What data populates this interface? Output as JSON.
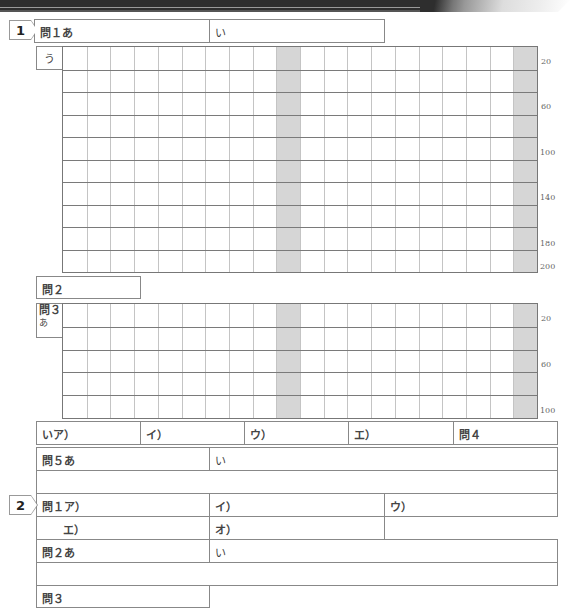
{
  "sections": [
    {
      "number": "1"
    },
    {
      "number": "2"
    }
  ],
  "s1": {
    "q1": {
      "a_label": "問１あ",
      "i_label": "い"
    },
    "q1u": {
      "label": "う",
      "counts": [
        "20",
        "60",
        "100",
        "140",
        "180",
        "200"
      ]
    },
    "q2": {
      "label": "問２"
    },
    "q3": {
      "label_top": "問３",
      "label_sub": "あ",
      "counts": [
        "20",
        "60",
        "100"
      ]
    },
    "row_i": {
      "cells": [
        "いア）",
        "イ）",
        "ウ）",
        "エ）",
        "問４"
      ]
    },
    "q5": {
      "a_label": "問５あ",
      "i_label": "い"
    }
  },
  "s2": {
    "q1": {
      "row1": [
        "問１ア）",
        "イ）",
        "ウ）"
      ],
      "row2": [
        "エ）",
        "オ）"
      ]
    },
    "q2": {
      "a_label": "問２あ",
      "i_label": "い"
    },
    "q3": {
      "label": "問３"
    }
  },
  "grid": {
    "columns": 20,
    "shaded_columns": [
      10,
      20
    ]
  }
}
